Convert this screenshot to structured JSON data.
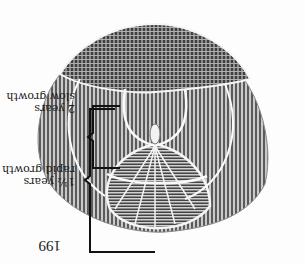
{
  "page": {
    "orientation": "rotated 180 degrees",
    "page_number": "199"
  },
  "figure": {
    "annotations": [
      {
        "period": "2 years",
        "description": "slow growth"
      },
      {
        "period": "1½ years",
        "description": "rapid growth"
      }
    ]
  },
  "colors": {
    "ink": "#1a1a1a",
    "scale_dark": "#555555",
    "scale_light": "#9a9a9a",
    "paper": "#fdfdfd"
  }
}
